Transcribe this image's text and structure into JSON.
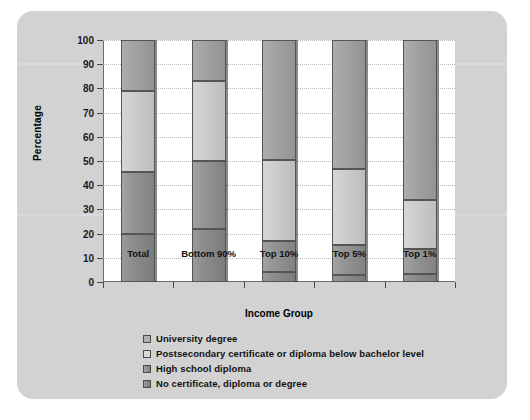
{
  "chart_data": {
    "type": "bar",
    "subtype": "stacked-100-percent",
    "title": "",
    "xlabel": "Income Group",
    "ylabel": "Percentage",
    "ylim": [
      0,
      100
    ],
    "ytick_step": 10,
    "yticks": [
      "100",
      "90",
      "80",
      "70",
      "60",
      "50",
      "40",
      "30",
      "20",
      "10",
      "0"
    ],
    "grid": true,
    "legend_position": "bottom",
    "categories": [
      "Total",
      "Bottom 90%",
      "Top 10%",
      "Top 5%",
      "Top 1%"
    ],
    "series": [
      {
        "name": "No certificate, diploma or degree",
        "values": [
          20.0,
          22.0,
          4.0,
          3.0,
          3.5
        ]
      },
      {
        "name": "High school diploma",
        "values": [
          25.5,
          28.0,
          13.0,
          12.5,
          10.0
        ]
      },
      {
        "name": "Postsecondary certificate or diploma below bachelor level",
        "values": [
          33.5,
          33.0,
          33.5,
          31.0,
          20.5
        ]
      },
      {
        "name": "University degree",
        "values": [
          21.0,
          17.0,
          49.5,
          53.5,
          66.0
        ]
      }
    ],
    "stack_order_bottom_to_top": [
      "No certificate, diploma or degree",
      "High school diploma",
      "Postsecondary certificate or diploma below bachelor level",
      "University degree"
    ],
    "legend": [
      "University degree",
      "Postsecondary certificate or diploma below bachelor level",
      "High school diploma",
      "No certificate, diploma or degree"
    ],
    "colors": {
      "university_degree": "#a3a3a3",
      "postsecondary_certificate": "#cccccc",
      "high_school_diploma": "#949494",
      "no_certificate": "#8d8d8d",
      "panel_background": "#d2d2d2",
      "plot_background": "#ffffff",
      "axis": "#6d6d6d",
      "gridline": "#b9b9b9",
      "text": "#111111"
    }
  }
}
